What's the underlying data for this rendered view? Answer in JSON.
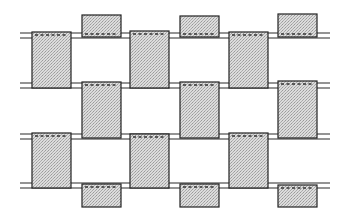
{
  "diagram": {
    "type": "weave-pattern",
    "colors": {
      "background": "#ffffff",
      "strip_fill": "#d9d9d9",
      "stipple": "#9a9a9a",
      "line": "#222222"
    },
    "horizontal_threads": [
      {
        "y_top": 33,
        "y_bottom": 38
      },
      {
        "y_top": 83,
        "y_bottom": 88
      },
      {
        "y_top": 134,
        "y_bottom": 139
      },
      {
        "y_top": 183,
        "y_bottom": 188
      }
    ],
    "columns": [
      {
        "id": "A",
        "x": 32,
        "w": 39
      },
      {
        "id": "B",
        "x": 82,
        "w": 39
      },
      {
        "id": "C",
        "x": 130,
        "w": 39
      },
      {
        "id": "D",
        "x": 180,
        "w": 39
      },
      {
        "id": "E",
        "x": 229,
        "w": 39
      },
      {
        "id": "F",
        "x": 278,
        "w": 39
      }
    ],
    "blocks": [
      {
        "col": "B",
        "y": 15,
        "h": 22
      },
      {
        "col": "D",
        "y": 16,
        "h": 21
      },
      {
        "col": "F",
        "y": 14,
        "h": 23
      },
      {
        "col": "A",
        "y": 32,
        "h": 56
      },
      {
        "col": "C",
        "y": 31,
        "h": 57
      },
      {
        "col": "E",
        "y": 32,
        "h": 56
      },
      {
        "col": "B",
        "y": 82,
        "h": 56
      },
      {
        "col": "D",
        "y": 82,
        "h": 56
      },
      {
        "col": "F",
        "y": 81,
        "h": 57
      },
      {
        "col": "A",
        "y": 133,
        "h": 55
      },
      {
        "col": "C",
        "y": 134,
        "h": 54
      },
      {
        "col": "E",
        "y": 133,
        "h": 55
      },
      {
        "col": "B",
        "y": 184,
        "h": 23
      },
      {
        "col": "D",
        "y": 184,
        "h": 23
      },
      {
        "col": "F",
        "y": 185,
        "h": 22
      }
    ]
  }
}
